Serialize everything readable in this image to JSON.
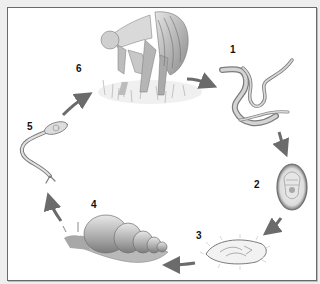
{
  "diagram": {
    "type": "life-cycle",
    "colors": {
      "background": "#eeeeee",
      "frame_fill": "#ffffff",
      "frame_border": "#6a6a6a",
      "arrow": "#6b6b6b",
      "label": "#111111"
    },
    "stages": [
      {
        "number": "1",
        "illustration": "worms"
      },
      {
        "number": "2",
        "illustration": "egg"
      },
      {
        "number": "3",
        "illustration": "ciliated-larva"
      },
      {
        "number": "4",
        "illustration": "snail"
      },
      {
        "number": "5",
        "illustration": "fork-tailed-larva"
      },
      {
        "number": "6",
        "illustration": "person-wading-in-water"
      }
    ],
    "arrows": [
      {
        "from": "6",
        "to": "1"
      },
      {
        "from": "1",
        "to": "2"
      },
      {
        "from": "2",
        "to": "3"
      },
      {
        "from": "3",
        "to": "4"
      },
      {
        "from": "4",
        "to": "5"
      },
      {
        "from": "5",
        "to": "6"
      }
    ]
  }
}
